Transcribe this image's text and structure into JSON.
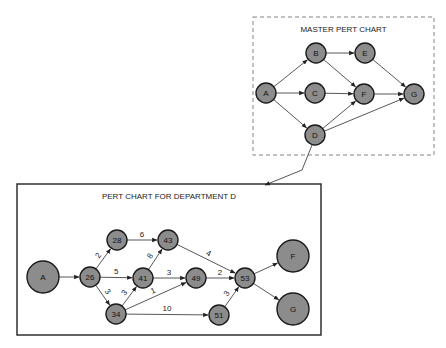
{
  "master": {
    "title": "MASTER PERT CHART",
    "box": {
      "x": 253,
      "y": 17,
      "w": 181,
      "h": 138,
      "style": "dashed"
    },
    "nodes": [
      {
        "id": "A",
        "label": "A",
        "x": 266,
        "y": 93,
        "r": 10
      },
      {
        "id": "B",
        "label": "B",
        "x": 316,
        "y": 53,
        "r": 10
      },
      {
        "id": "C",
        "label": "C",
        "x": 315,
        "y": 93,
        "r": 10
      },
      {
        "id": "D",
        "label": "D",
        "x": 315,
        "y": 135,
        "r": 10
      },
      {
        "id": "E",
        "label": "E",
        "x": 365,
        "y": 53,
        "r": 10
      },
      {
        "id": "F",
        "label": "F",
        "x": 364,
        "y": 94,
        "r": 10
      },
      {
        "id": "G",
        "label": "G",
        "x": 414,
        "y": 94,
        "r": 10
      }
    ],
    "edges": [
      {
        "from": "A",
        "to": "B"
      },
      {
        "from": "A",
        "to": "C"
      },
      {
        "from": "A",
        "to": "D"
      },
      {
        "from": "B",
        "to": "E"
      },
      {
        "from": "B",
        "to": "F"
      },
      {
        "from": "C",
        "to": "F"
      },
      {
        "from": "D",
        "to": "F"
      },
      {
        "from": "D",
        "to": "G"
      },
      {
        "from": "E",
        "to": "G"
      },
      {
        "from": "F",
        "to": "G"
      }
    ]
  },
  "connector": {
    "points": [
      [
        312,
        145
      ],
      [
        302,
        170
      ],
      [
        265,
        185
      ]
    ],
    "label": "D expands to department chart"
  },
  "department": {
    "title": "PERT CHART FOR DEPARTMENT D",
    "box": {
      "x": 17,
      "y": 184,
      "w": 304,
      "h": 151,
      "style": "solid"
    },
    "nodes": [
      {
        "id": "A",
        "label": "A",
        "x": 43,
        "y": 277,
        "r": 16
      },
      {
        "id": "26",
        "label": "26",
        "x": 90,
        "y": 277,
        "r": 10
      },
      {
        "id": "28",
        "label": "28",
        "x": 117,
        "y": 240,
        "r": 10
      },
      {
        "id": "34",
        "label": "34",
        "x": 116,
        "y": 314,
        "r": 10
      },
      {
        "id": "41",
        "label": "41",
        "x": 143,
        "y": 278,
        "r": 10
      },
      {
        "id": "43",
        "label": "43",
        "x": 168,
        "y": 240,
        "r": 10
      },
      {
        "id": "49",
        "label": "49",
        "x": 196,
        "y": 278,
        "r": 10
      },
      {
        "id": "51",
        "label": "51",
        "x": 219,
        "y": 315,
        "r": 10
      },
      {
        "id": "53",
        "label": "53",
        "x": 245,
        "y": 278,
        "r": 10
      },
      {
        "id": "F",
        "label": "F",
        "x": 293,
        "y": 256,
        "r": 16
      },
      {
        "id": "G",
        "label": "G",
        "x": 293,
        "y": 309,
        "r": 16
      }
    ],
    "edges": [
      {
        "from": "A",
        "to": "26",
        "weight": ""
      },
      {
        "from": "26",
        "to": "28",
        "weight": "2"
      },
      {
        "from": "26",
        "to": "41",
        "weight": "5"
      },
      {
        "from": "26",
        "to": "34",
        "weight": "3"
      },
      {
        "from": "28",
        "to": "43",
        "weight": "6"
      },
      {
        "from": "41",
        "to": "43",
        "weight": "8"
      },
      {
        "from": "41",
        "to": "49",
        "weight": "3"
      },
      {
        "from": "34",
        "to": "41",
        "weight": "3"
      },
      {
        "from": "34",
        "to": "49",
        "weight": "1"
      },
      {
        "from": "34",
        "to": "51",
        "weight": "10"
      },
      {
        "from": "43",
        "to": "53",
        "weight": "4"
      },
      {
        "from": "49",
        "to": "53",
        "weight": "2"
      },
      {
        "from": "51",
        "to": "53",
        "weight": "3"
      },
      {
        "from": "53",
        "to": "F",
        "weight": ""
      },
      {
        "from": "53",
        "to": "G",
        "weight": ""
      }
    ]
  }
}
